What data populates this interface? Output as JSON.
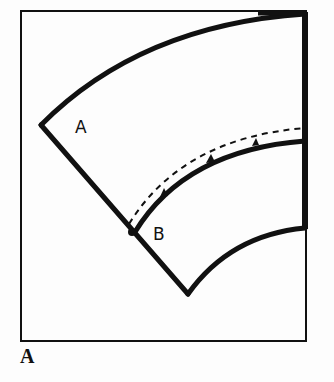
{
  "figure": {
    "caption": "A",
    "labels": {
      "piece_a": "A",
      "piece_b": "B"
    },
    "colors": {
      "ink": "#111111",
      "background": "#fdfdfd"
    },
    "elements": [
      "outer frame rectangle",
      "piece A: large curved sector outline",
      "piece B: smaller curved band below A",
      "dashed seam line above piece B's top curve",
      "three notch marks along piece B's top curve"
    ]
  }
}
